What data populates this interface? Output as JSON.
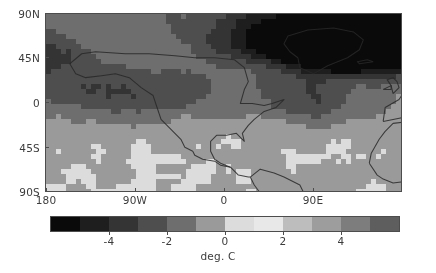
{
  "figure": {
    "background_color": "#ffffff",
    "axes_color": "#4d4d4d",
    "text_color": "#3c3c3c"
  },
  "chart_data": {
    "type": "heatmap",
    "title": "",
    "subtitle": "",
    "xlabel": "",
    "ylabel": "",
    "projection": "equirectangular",
    "grid": false,
    "legend_position": "bottom",
    "xlim": [
      -180,
      180
    ],
    "ylim": [
      -90,
      90
    ],
    "x_tick_values": [
      -180,
      -90,
      0,
      90
    ],
    "x_tick_labels": [
      "180",
      "90W",
      "0",
      "90E"
    ],
    "y_tick_values": [
      90,
      45,
      0,
      -45,
      -90
    ],
    "y_tick_labels": [
      "90N",
      "45N",
      "0",
      "45S",
      "90S"
    ],
    "colorbar": {
      "unit_label": "deg. C",
      "tick_values": [
        -4,
        -2,
        0,
        2,
        4
      ],
      "tick_labels": [
        "-4",
        "-2",
        "0",
        "2",
        "4"
      ],
      "vmin": -6,
      "vmax": 6,
      "n_levels": 12,
      "level_boundaries": [
        -6,
        -5,
        -4,
        -3,
        -2,
        -1,
        0,
        1,
        2,
        3,
        4,
        5,
        6
      ],
      "colors": [
        "#0a0a0a",
        "#1e1e1e",
        "#343434",
        "#4e4e4e",
        "#6e6e6e",
        "#9a9a9a",
        "#dcdcdc",
        "#e8e8e8",
        "#bdbdbd",
        "#9d9d9d",
        "#7d7d7d",
        "#5e5e5e"
      ]
    },
    "field_description": "Global surface temperature anomaly; strong negative (dark) anomaly centred over the Arctic, Greenland and northern Eurasia, weaker positive/near-zero (light) values across the tropics and Southern Ocean.",
    "regions": [
      {
        "name": "arctic-greenland-cold-core",
        "lon_range": [
          -80,
          20
        ],
        "lat_range": [
          60,
          90
        ],
        "value": -6
      },
      {
        "name": "northern-eurasia-cold",
        "lon_range": [
          20,
          140
        ],
        "lat_range": [
          55,
          90
        ],
        "value": -3
      },
      {
        "name": "north-america-mid",
        "lon_range": [
          -140,
          -70
        ],
        "lat_range": [
          25,
          60
        ],
        "value": -2
      },
      {
        "name": "north-pacific",
        "lon_range": [
          -180,
          -130
        ],
        "lat_range": [
          30,
          65
        ],
        "value": -2
      },
      {
        "name": "north-atlantic",
        "lon_range": [
          -60,
          -10
        ],
        "lat_range": [
          30,
          60
        ],
        "value": -3
      },
      {
        "name": "mediterranean-mideast",
        "lon_range": [
          0,
          70
        ],
        "lat_range": [
          25,
          50
        ],
        "value": -2
      },
      {
        "name": "east-asia",
        "lon_range": [
          100,
          150
        ],
        "lat_range": [
          25,
          55
        ],
        "value": -2
      },
      {
        "name": "tropics",
        "lon_range": [
          -180,
          180
        ],
        "lat_range": [
          -25,
          20
        ],
        "value": 0
      },
      {
        "name": "southern-ocean",
        "lon_range": [
          -180,
          180
        ],
        "lat_range": [
          -70,
          -35
        ],
        "value": 0
      },
      {
        "name": "antarctica",
        "lon_range": [
          -180,
          180
        ],
        "lat_range": [
          -90,
          -70
        ],
        "value": 0
      }
    ]
  }
}
